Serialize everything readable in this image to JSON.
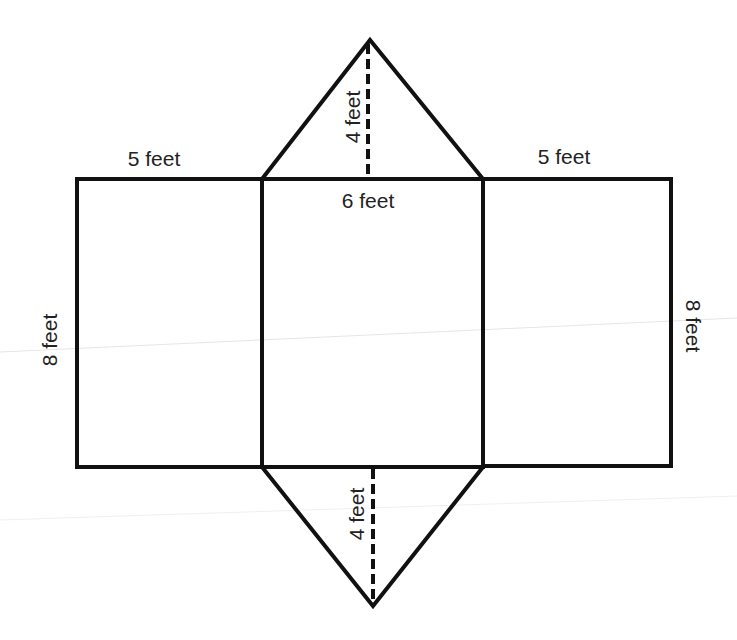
{
  "diagram": {
    "type": "triangular-prism-net",
    "colors": {
      "stroke": "#111111",
      "text": "#222222",
      "background": "#ffffff"
    },
    "labels": {
      "left_top_width": "5 feet",
      "right_top_width": "5 feet",
      "middle_width": "6 feet",
      "left_height": "8 feet",
      "right_height": "8 feet",
      "top_triangle_height": "4 feet",
      "bottom_triangle_height": "4 feet"
    },
    "shapes": [
      {
        "name": "left-rectangle",
        "width": "5 feet",
        "height": "8 feet"
      },
      {
        "name": "middle-rectangle",
        "width": "6 feet",
        "height": "8 feet"
      },
      {
        "name": "right-rectangle",
        "width": "5 feet",
        "height": "8 feet"
      },
      {
        "name": "top-triangle",
        "base": "6 feet",
        "height": "4 feet"
      },
      {
        "name": "bottom-triangle",
        "base": "6 feet",
        "height": "4 feet"
      }
    ]
  }
}
